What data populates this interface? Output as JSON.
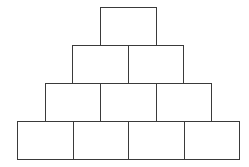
{
  "diagram": {
    "type": "brick-pyramid",
    "line_color": "#3a3a3a",
    "background": "#ffffff",
    "brick_width": 55.5,
    "brick_height": 38,
    "rows": [
      {
        "index": 1,
        "count": 1,
        "left": 100,
        "top": 7
      },
      {
        "index": 2,
        "count": 2,
        "left": 72,
        "top": 45
      },
      {
        "index": 3,
        "count": 3,
        "left": 44.5,
        "top": 83
      },
      {
        "index": 4,
        "count": 4,
        "left": 17,
        "top": 121
      }
    ]
  }
}
